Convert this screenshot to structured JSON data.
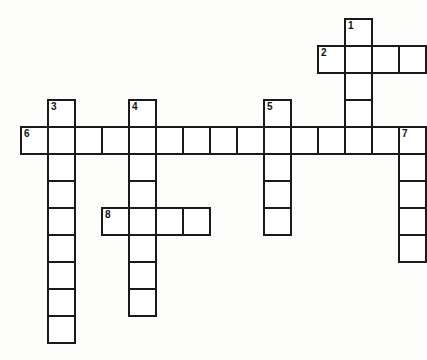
{
  "page": {
    "title": "Crossword Puzzle Grid",
    "background_color": "#fdfdfc",
    "cell_fill_color": "#ffffff",
    "cell_border_color": "#1a1a1a",
    "number_color": "#111111"
  },
  "grid": {
    "cell_size_px": 27,
    "origin_x_px": 20,
    "origin_y_px": 18,
    "columns": 15,
    "rows": 13,
    "border_width_px": 2
  },
  "entries": [
    {
      "number": "1",
      "direction": "down",
      "start_col": 12,
      "start_row": 0,
      "length": 5
    },
    {
      "number": "2",
      "direction": "across",
      "start_col": 11,
      "start_row": 1,
      "length": 4
    },
    {
      "number": "3",
      "direction": "down",
      "start_col": 1,
      "start_row": 3,
      "length": 9
    },
    {
      "number": "4",
      "direction": "down",
      "start_col": 4,
      "start_row": 3,
      "length": 8
    },
    {
      "number": "5",
      "direction": "down",
      "start_col": 9,
      "start_row": 3,
      "length": 5
    },
    {
      "number": "6",
      "direction": "across",
      "start_col": 0,
      "start_row": 4,
      "length": 15
    },
    {
      "number": "7",
      "direction": "down",
      "start_col": 14,
      "start_row": 4,
      "length": 5
    },
    {
      "number": "8",
      "direction": "across",
      "start_col": 3,
      "start_row": 7,
      "length": 4
    }
  ],
  "numbered_cells": [
    {
      "number": "1",
      "col": 12,
      "row": 0
    },
    {
      "number": "2",
      "col": 11,
      "row": 1
    },
    {
      "number": "3",
      "col": 1,
      "row": 3
    },
    {
      "number": "4",
      "col": 4,
      "row": 3
    },
    {
      "number": "5",
      "col": 9,
      "row": 3
    },
    {
      "number": "6",
      "col": 0,
      "row": 4
    },
    {
      "number": "7",
      "col": 14,
      "row": 4
    },
    {
      "number": "8",
      "col": 3,
      "row": 7
    }
  ],
  "letters": []
}
